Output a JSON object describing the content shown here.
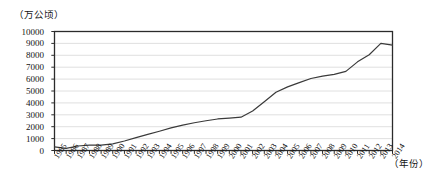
{
  "chart_data": {
    "type": "line",
    "title": "",
    "xlabel": "（年份）",
    "ylabel": "（万公顷）",
    "ylim": [
      0,
      10000
    ],
    "xlim": [
      1985,
      2014
    ],
    "grid": true,
    "legend": "none",
    "y_ticks": [
      10000,
      9000,
      8000,
      7000,
      6000,
      5000,
      4000,
      3000,
      2000,
      1000,
      0
    ],
    "categories": [
      "1985",
      "1986",
      "1987",
      "1988",
      "1989",
      "1990",
      "1991",
      "1992",
      "1993",
      "1994",
      "1995",
      "1996",
      "1997",
      "1998",
      "1999",
      "2000",
      "2001",
      "2002",
      "2003",
      "2004",
      "2005",
      "2006",
      "2007",
      "2008",
      "2009",
      "2010",
      "2011",
      "2012",
      "2013",
      "2014"
    ],
    "values": [
      300,
      180,
      380,
      450,
      460,
      560,
      800,
      1080,
      1350,
      1620,
      1900,
      2130,
      2330,
      2500,
      2650,
      2720,
      2800,
      3320,
      4100,
      4900,
      5350,
      5700,
      6050,
      6250,
      6400,
      6650,
      7450,
      8050,
      9000,
      8850
    ],
    "series_name": "面积",
    "line_color": "#3a3a3a",
    "grid_color": "#d8d8d8",
    "axis_color": "#2b2b2b"
  },
  "axes": {
    "y_unit_label": "（万公顷）",
    "x_unit_label": "（年份）"
  }
}
